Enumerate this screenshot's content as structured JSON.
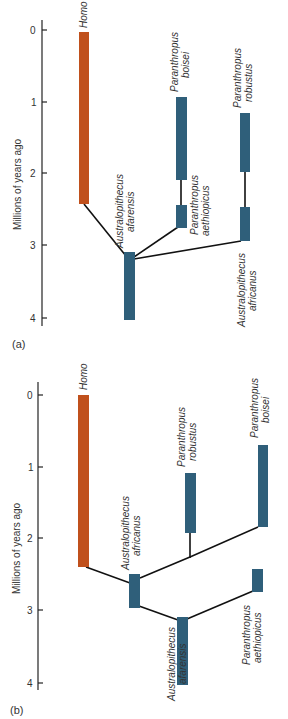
{
  "colors": {
    "homo": "#c0501c",
    "australopith": "#2f5f7a",
    "branch": "#111111",
    "axis": "#222222"
  },
  "axis": {
    "title": "Millions of years ago",
    "ticks": [
      "0",
      "1",
      "2",
      "3",
      "4"
    ]
  },
  "panels": [
    {
      "label": "(a)",
      "taxa": {
        "homo": "Homo",
        "afarensis": [
          "Australopithecus",
          "afarensis"
        ],
        "boisei": [
          "Paranthropus",
          "boisei"
        ],
        "aethiopicus": [
          "Paranthropus",
          "aethiopicus"
        ],
        "robustus": [
          "Paranthropus",
          "robustus"
        ],
        "africanus": [
          "Australopithecus",
          "africanus"
        ]
      }
    },
    {
      "label": "(b)",
      "taxa": {
        "homo": "Homo",
        "africanus": [
          "Australopithecus",
          "africanus"
        ],
        "robustus": [
          "Paranthropus",
          "robustus"
        ],
        "boisei": [
          "Paranthropus",
          "boisei"
        ],
        "afarensis": [
          "Australopithecus",
          "afarensis"
        ],
        "aethiopicus": [
          "Paranthropus",
          "aethiopicus"
        ]
      }
    }
  ]
}
